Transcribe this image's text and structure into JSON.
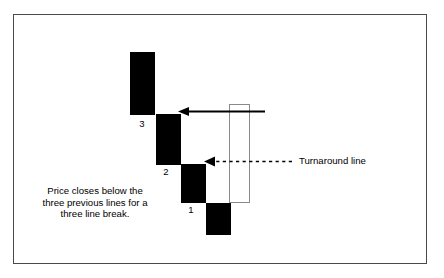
{
  "figure": {
    "kind": "three-line-break-chart-diagram",
    "background_color": "#ffffff",
    "frame_color": "#4a4a4a",
    "block_fill_color": "#000000",
    "turnaround_block_fill": "transparent",
    "turnaround_block_stroke": "#8a8a8a"
  },
  "blocks": [
    {
      "label": "3",
      "label_x": 137,
      "label_y": 119,
      "x": 130,
      "y": 52,
      "w": 25,
      "h": 63,
      "fill": "#000000"
    },
    {
      "label": "2",
      "label_x": 161,
      "label_y": 166,
      "x": 156,
      "y": 114,
      "w": 25,
      "h": 51,
      "fill": "#000000"
    },
    {
      "label": "1",
      "label_x": 186,
      "label_y": 205,
      "x": 181,
      "y": 164,
      "w": 25,
      "h": 39,
      "fill": "#000000"
    },
    {
      "label": "",
      "label_x": 0,
      "label_y": 0,
      "x": 206,
      "y": 203,
      "w": 25,
      "h": 32,
      "fill": "#000000"
    }
  ],
  "turnaround_block": {
    "x": 229,
    "y": 104,
    "w": 21,
    "h": 99
  },
  "arrows": {
    "solid": {
      "name": "break-confirmation-arrow",
      "style": "solid",
      "x_start": 265,
      "x_end": 178,
      "y": 111,
      "color": "#000000"
    },
    "dashed": {
      "name": "turnaround-line-arrow",
      "style": "dashed",
      "x_start": 292,
      "x_end": 204,
      "y": 161,
      "color": "#000000"
    }
  },
  "labels": {
    "annotation_line_1": "Price closes below the",
    "annotation_line_2": "three previous lines for a",
    "annotation_line_3": "three line break.",
    "turnaround_line": "Turnaround line"
  }
}
